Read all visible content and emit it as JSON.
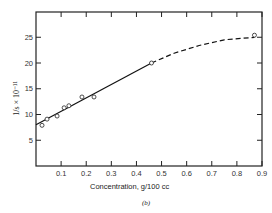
{
  "chart_data": {
    "type": "scatter",
    "title": "",
    "xlabel": "Concentration, g/100 cc",
    "ylabel": "1/s × 10^-11",
    "caption": "(b)",
    "xlim": [
      0,
      0.9
    ],
    "ylim": [
      0,
      29
    ],
    "x_ticks": [
      "0.1",
      "0.2",
      "0.3",
      "0.4",
      "0.5",
      "0.6",
      "0.7",
      "0.8",
      "0.9"
    ],
    "y_ticks": [
      "5",
      "10",
      "15",
      "20",
      "25"
    ],
    "grid": false,
    "series": [
      {
        "name": "measured",
        "marker": "open-circle",
        "x": [
          0.024,
          0.044,
          0.084,
          0.112,
          0.131,
          0.183,
          0.231,
          0.46,
          0.87
        ],
        "y": [
          7.9,
          9.1,
          9.7,
          11.3,
          11.7,
          13.4,
          13.4,
          20.0,
          25.4
        ]
      },
      {
        "name": "linear fit",
        "style": "solid",
        "x": [
          0.0,
          0.46
        ],
        "y": [
          8.0,
          20.0
        ]
      },
      {
        "name": "extrapolated curve",
        "style": "dashed",
        "x": [
          0.46,
          0.55,
          0.65,
          0.75,
          0.87
        ],
        "y": [
          20.0,
          21.9,
          23.4,
          24.5,
          25.0
        ]
      }
    ]
  },
  "labels": {
    "xlabel": "Concentration, g/100 cc",
    "ylabel": "1/s × 10⁻¹¹",
    "caption": "(b)"
  }
}
